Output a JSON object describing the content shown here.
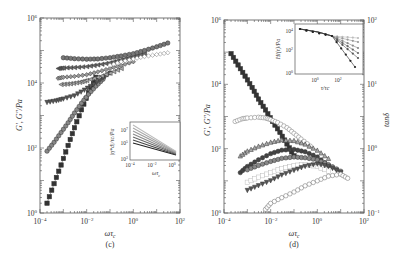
{
  "figure": {
    "panels": [
      "(c)",
      "(d)"
    ]
  },
  "chart_data": [
    {
      "id": "panel-c",
      "type": "scatter",
      "title": "",
      "panel_label": "(c)",
      "xlabel": "ωτ_c",
      "ylabel": "G′, G″/Pa",
      "xscale": "log",
      "yscale": "log",
      "xlim": [
        0.0001,
        100
      ],
      "ylim": [
        1,
        1000000
      ],
      "xticks": [
        "10^-4",
        "10^-2",
        "10^0",
        "10^2"
      ],
      "yticks": [
        "10^0",
        "10^2",
        "10^4",
        "10^6"
      ],
      "grid": false,
      "legend": "none",
      "series": [
        {
          "name": "G′ series 1 (dark squares)",
          "marker": "square",
          "color": "#333333",
          "x": [
            0.0002,
            0.0004,
            0.0008,
            0.0016,
            0.003,
            0.006,
            0.012,
            0.025
          ],
          "y": [
            2,
            8,
            30,
            120,
            420,
            1500,
            5000,
            15000
          ]
        },
        {
          "name": "G′ series 2 (grey circles)",
          "marker": "circle",
          "color": "#888888",
          "x": [
            0.0002,
            0.0004,
            0.0008,
            0.0016,
            0.003,
            0.006,
            0.012,
            0.025,
            0.05
          ],
          "y": [
            80,
            150,
            300,
            600,
            1200,
            2400,
            4500,
            8000,
            13000
          ]
        },
        {
          "name": "G′ series 3 (down triangles)",
          "marker": "triangle-down",
          "color": "#555555",
          "x": [
            0.0002,
            0.0005,
            0.001,
            0.003,
            0.008,
            0.02,
            0.05,
            0.1
          ],
          "y": [
            2500,
            2800,
            3200,
            4000,
            6000,
            9000,
            14000,
            20000
          ]
        },
        {
          "name": "G′ series 4 (left triangles)",
          "marker": "triangle-left",
          "color": "#aaaaaa",
          "x": [
            0.0008,
            0.002,
            0.005,
            0.01,
            0.03,
            0.1,
            0.3
          ],
          "y": [
            9000,
            9500,
            10500,
            12000,
            15000,
            20000,
            28000
          ]
        },
        {
          "name": "G′ series 5 (grey diamonds)",
          "marker": "diamond",
          "color": "#999999",
          "x": [
            0.0006,
            0.001,
            0.003,
            0.01,
            0.03,
            0.1,
            0.3,
            1
          ],
          "y": [
            14000,
            15000,
            16000,
            18000,
            22000,
            28000,
            35000,
            45000
          ]
        },
        {
          "name": "G′ series 6 (dark left triangles)",
          "marker": "triangle-left",
          "color": "#666666",
          "x": [
            0.0006,
            0.001,
            0.003,
            0.01,
            0.03,
            0.1,
            0.3,
            1,
            3
          ],
          "y": [
            28000,
            29000,
            30000,
            32000,
            36000,
            42000,
            52000,
            65000,
            80000
          ]
        },
        {
          "name": "G′ series 7 (dark grey hexagons)",
          "marker": "circle",
          "color": "#777777",
          "x": [
            0.001,
            0.003,
            0.01,
            0.03,
            0.1,
            0.3,
            1,
            3,
            10,
            30
          ],
          "y": [
            60000,
            56000,
            54000,
            55000,
            60000,
            68000,
            80000,
            100000,
            130000,
            170000
          ]
        },
        {
          "name": "G″ open diamonds",
          "marker": "diamond-open",
          "color": "#777777",
          "x": [
            0.1,
            0.3,
            1,
            3,
            10,
            30
          ],
          "y": [
            35000,
            45000,
            55000,
            65000,
            75000,
            85000
          ]
        }
      ],
      "inset": {
        "xlabel": "ωτ_c",
        "ylabel": "|η*_d|/τ_c/Pa",
        "xscale": "log",
        "yscale": "log",
        "xticks": [
          "10^-4",
          "10^-2",
          "10^0"
        ],
        "yticks": [
          "10^3",
          "10^5",
          "10^7"
        ],
        "series_description": "Bundle of decreasing lines converging at high ωτ_c"
      }
    },
    {
      "id": "panel-d",
      "type": "scatter",
      "title": "",
      "panel_label": "(d)",
      "xlabel": "ωτ_c",
      "ylabel": "G′, G″/Pa",
      "ylabel_right": "tanδ",
      "xscale": "log",
      "yscale": "log",
      "xlim": [
        0.0001,
        100
      ],
      "ylim": [
        1,
        1000000
      ],
      "ylim_right": [
        0.1,
        100
      ],
      "xticks": [
        "10^-4",
        "10^-2",
        "10^0",
        "10^2"
      ],
      "yticks": [
        "10^0",
        "10^2",
        "10^4",
        "10^6"
      ],
      "yticks_right": [
        "10^-1",
        "10^0",
        "10^1",
        "10^2"
      ],
      "grid": false,
      "legend": "none",
      "series": [
        {
          "name": "tanδ (dark squares)",
          "marker": "square",
          "color": "#333333",
          "x": [
            0.0002,
            0.0004,
            0.0008,
            0.0016,
            0.003,
            0.006,
            0.012,
            0.025,
            0.05,
            0.1
          ],
          "y": [
            90000,
            40000,
            18000,
            8000,
            3500,
            1600,
            700,
            320,
            140,
            60
          ]
        },
        {
          "name": "series circles (upper)",
          "marker": "circle-open",
          "color": "#777777",
          "x": [
            0.0003,
            0.0006,
            0.001,
            0.003,
            0.006,
            0.01,
            0.02,
            0.05,
            0.1,
            0.2,
            0.5
          ],
          "y": [
            700,
            850,
            900,
            950,
            900,
            800,
            650,
            450,
            300,
            200,
            120
          ]
        },
        {
          "name": "series up triangles",
          "marker": "triangle-up",
          "color": "#aaaaaa",
          "x": [
            0.0005,
            0.001,
            0.003,
            0.01,
            0.03,
            0.1,
            0.3,
            1,
            3
          ],
          "y": [
            60,
            85,
            120,
            160,
            190,
            180,
            140,
            90,
            50
          ]
        },
        {
          "name": "series dark circles",
          "marker": "circle",
          "color": "#444444",
          "x": [
            0.0005,
            0.001,
            0.003,
            0.01,
            0.03,
            0.1,
            0.3,
            1,
            3
          ],
          "y": [
            18,
            28,
            45,
            70,
            90,
            95,
            80,
            55,
            30
          ]
        },
        {
          "name": "series grey hexagons",
          "marker": "circle",
          "color": "#888888",
          "x": [
            0.001,
            0.003,
            0.01,
            0.03,
            0.1,
            0.3,
            1,
            3,
            10
          ],
          "y": [
            22,
            30,
            40,
            50,
            55,
            52,
            45,
            32,
            20
          ]
        },
        {
          "name": "series light squares",
          "marker": "square-open",
          "color": "#bbbbbb",
          "x": [
            0.001,
            0.003,
            0.01,
            0.03,
            0.1,
            0.3,
            1,
            3
          ],
          "y": [
            9,
            13,
            18,
            24,
            30,
            32,
            28,
            20
          ]
        },
        {
          "name": "series down triangles",
          "marker": "triangle-down",
          "color": "#555555",
          "x": [
            0.001,
            0.003,
            0.01,
            0.03,
            0.1,
            0.3,
            1,
            3,
            10
          ],
          "y": [
            5,
            7,
            10,
            15,
            21,
            28,
            33,
            28,
            18
          ]
        },
        {
          "name": "series circles (lower)",
          "marker": "circle-open",
          "color": "#666666",
          "x": [
            0.006,
            0.01,
            0.03,
            0.1,
            0.3,
            1,
            3,
            10,
            20
          ],
          "y": [
            1.3,
            2,
            3,
            4.5,
            7,
            10,
            14,
            16,
            12
          ]
        }
      ],
      "inset": {
        "xlabel": "τ/τ_c",
        "ylabel": "H_l(τ)/Pa",
        "xscale": "log",
        "yscale": "log",
        "xticks": [
          "10^0",
          "10^2"
        ],
        "yticks": [
          "10^0",
          "10^2",
          "10^4"
        ],
        "series_description": "Relaxation spectra starting together near 10^4 and fanning out downward at large τ/τ_c"
      }
    }
  ],
  "labels": {
    "c": {
      "panel": "(c)",
      "xlabel_main": "ωτ",
      "xlabel_sub": "c",
      "ylabel": "G′, G″/Pa",
      "xticks": [
        {
          "base": "10",
          "exp": "−4"
        },
        {
          "base": "10",
          "exp": "−2"
        },
        {
          "base": "10",
          "exp": "0"
        },
        {
          "base": "10",
          "exp": "2"
        }
      ],
      "yticks": [
        {
          "base": "10",
          "exp": "0"
        },
        {
          "base": "10",
          "exp": "2"
        },
        {
          "base": "10",
          "exp": "4"
        },
        {
          "base": "10",
          "exp": "6"
        }
      ],
      "inset_ylabel": "|η*d|/τc/Pa",
      "inset_xlabel_main": "ωτ",
      "inset_xlabel_sub": "c",
      "inset_xticks": [
        {
          "base": "10",
          "exp": "−4"
        },
        {
          "base": "10",
          "exp": "−2"
        },
        {
          "base": "10",
          "exp": "0"
        }
      ],
      "inset_yticks": [
        {
          "base": "10",
          "exp": "3"
        },
        {
          "base": "10",
          "exp": "5"
        },
        {
          "base": "10",
          "exp": "7"
        }
      ]
    },
    "d": {
      "panel": "(d)",
      "xlabel_main": "ωτ",
      "xlabel_sub": "c",
      "ylabel": "G′, G″/Pa",
      "ylabel_right": "tanδ",
      "xticks": [
        {
          "base": "10",
          "exp": "−4"
        },
        {
          "base": "10",
          "exp": "−2"
        },
        {
          "base": "10",
          "exp": "0"
        },
        {
          "base": "10",
          "exp": "2"
        }
      ],
      "yticks": [
        {
          "base": "10",
          "exp": "0"
        },
        {
          "base": "10",
          "exp": "2"
        },
        {
          "base": "10",
          "exp": "4"
        },
        {
          "base": "10",
          "exp": "6"
        }
      ],
      "yticks_right": [
        {
          "base": "10",
          "exp": "−1"
        },
        {
          "base": "10",
          "exp": "0"
        },
        {
          "base": "10",
          "exp": "1"
        },
        {
          "base": "10",
          "exp": "2"
        }
      ],
      "inset_ylabel": "Hl(τ)/Pa",
      "inset_xlabel": "τ/τc",
      "inset_xticks": [
        {
          "base": "10",
          "exp": "0"
        },
        {
          "base": "10",
          "exp": "2"
        }
      ],
      "inset_yticks": [
        {
          "base": "10",
          "exp": "0"
        },
        {
          "base": "10",
          "exp": "2"
        },
        {
          "base": "10",
          "exp": "4"
        }
      ]
    }
  }
}
